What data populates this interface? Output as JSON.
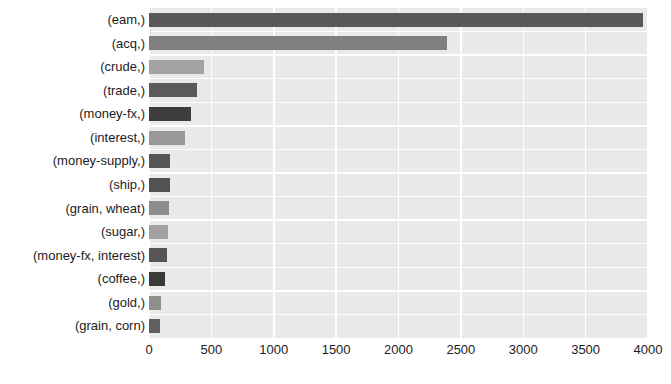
{
  "chart_data": {
    "type": "bar",
    "orientation": "horizontal",
    "title": "",
    "subtitle": "",
    "xlabel": "",
    "ylabel": "",
    "xlim": [
      0,
      4000
    ],
    "ylim": null,
    "grid": true,
    "legend": null,
    "legend_position": "none",
    "plot_background": "#eaeaea",
    "grid_color": "#ffffff",
    "xticks": [
      0,
      500,
      1000,
      1500,
      2000,
      2500,
      3000,
      3500,
      4000
    ],
    "xtick_labels": [
      "0",
      "500",
      "1000",
      "1500",
      "2000",
      "2500",
      "3000",
      "3500",
      "4000"
    ],
    "categories": [
      "(eam,)",
      "(acq,)",
      "(crude,)",
      "(trade,)",
      "(money-fx,)",
      "(interest,)",
      "(money-supply,)",
      "(ship,)",
      "(grain, wheat)",
      "(sugar,)",
      "(money-fx, interest)",
      "(coffee,)",
      "(gold,)",
      "(grain, corn)"
    ],
    "values": [
      3958,
      2388,
      443,
      384,
      334,
      292,
      167,
      167,
      159,
      150,
      142,
      125,
      100,
      92
    ],
    "bar_colors": [
      "#595959",
      "#7f7f7f",
      "#a3a3a3",
      "#5a5a5a",
      "#3d3d3d",
      "#999999",
      "#565656",
      "#525252",
      "#8d8d8d",
      "#a2a2a2",
      "#555555",
      "#3a3a3a",
      "#8f8f8f",
      "#5f5f5f"
    ]
  }
}
